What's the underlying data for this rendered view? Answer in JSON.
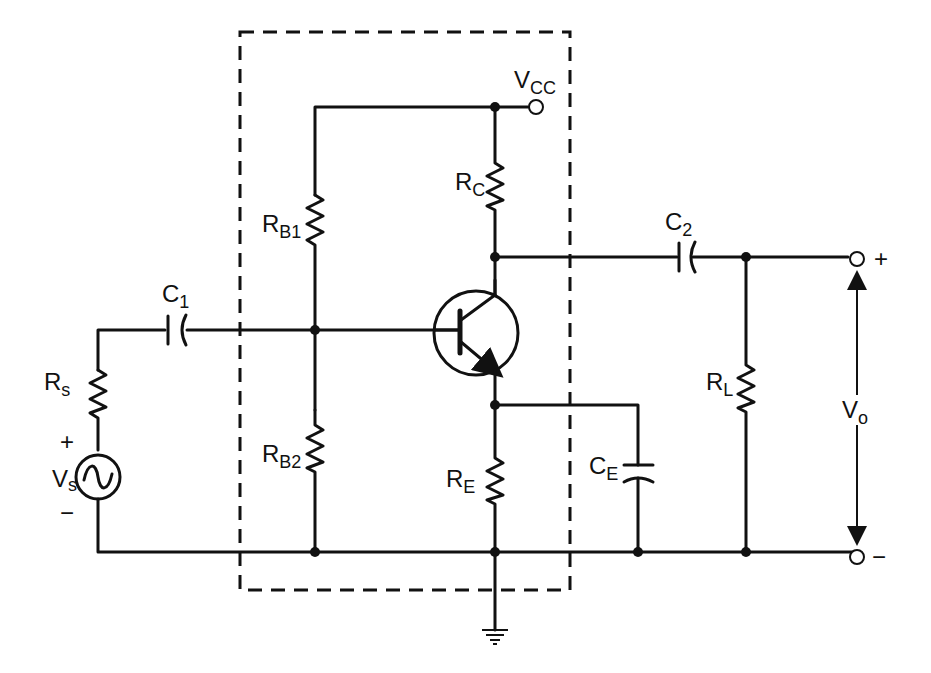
{
  "diagram": {
    "type": "circuit-schematic",
    "components": {
      "supply": {
        "main": "V",
        "sub": "CC"
      },
      "rb1": {
        "main": "R",
        "sub": "B1"
      },
      "rb2": {
        "main": "R",
        "sub": "B2"
      },
      "rc": {
        "main": "R",
        "sub": "C"
      },
      "re": {
        "main": "R",
        "sub": "E"
      },
      "ce": {
        "main": "C",
        "sub": "E"
      },
      "c1": {
        "main": "C",
        "sub": "1"
      },
      "c2": {
        "main": "C",
        "sub": "2"
      },
      "rl": {
        "main": "R",
        "sub": "L"
      },
      "rs": {
        "main": "R",
        "sub": "s"
      },
      "vs": {
        "main": "V",
        "sub": "s"
      },
      "vo": {
        "main": "V",
        "sub": "o"
      }
    },
    "polarity": {
      "vs_plus": "+",
      "vs_minus": "−",
      "out_plus": "+",
      "out_minus": "−"
    },
    "colors": {
      "line": "#111111",
      "background": "#ffffff"
    }
  }
}
